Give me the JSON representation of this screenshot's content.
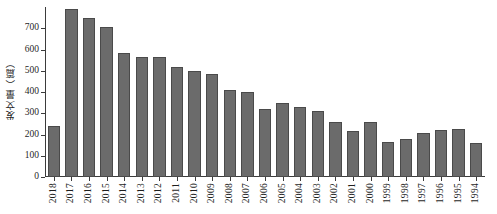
{
  "chart_data": {
    "type": "bar",
    "title": "",
    "subtitle": "",
    "xlabel": "",
    "ylabel": "发文量（篇）",
    "ylim": [
      0,
      800
    ],
    "yticks": [
      0,
      100,
      200,
      300,
      400,
      500,
      600,
      700
    ],
    "ytick_labels": [
      "0",
      "100",
      "200",
      "300",
      "400",
      "500",
      "600",
      "700"
    ],
    "grid": false,
    "legend": null,
    "legend_position": "none",
    "bar_color": "#6b6b6b",
    "bar_edge_color": "#4a4a4a",
    "axis_color": "#3b3b3b",
    "categories": [
      "2018",
      "2017",
      "2016",
      "2015",
      "2014",
      "2013",
      "2012",
      "2011",
      "2010",
      "2009",
      "2008",
      "2007",
      "2006",
      "2005",
      "2004",
      "2003",
      "2002",
      "2001",
      "2000",
      "1999",
      "1998",
      "1997",
      "1996",
      "1995",
      "1994"
    ],
    "values": [
      240,
      790,
      750,
      705,
      585,
      563,
      565,
      520,
      497,
      485,
      408,
      398,
      318,
      348,
      330,
      310,
      260,
      217,
      257,
      163,
      178,
      205,
      223,
      225,
      162
    ]
  }
}
